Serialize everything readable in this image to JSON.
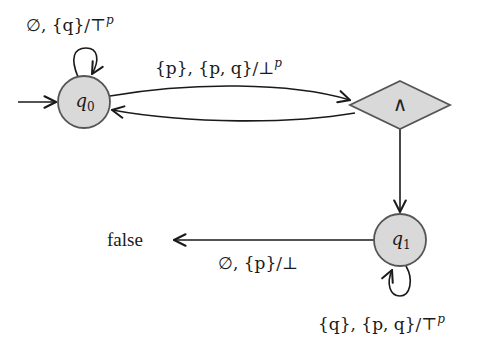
{
  "diagram": {
    "type": "alternating automaton",
    "colors": {
      "node_fill": "#d9d9d9",
      "node_stroke": "#555555",
      "edge": "#1a1a1a",
      "background": "#ffffff"
    },
    "nodes": [
      {
        "id": "q0",
        "label": "q",
        "subscript": "0",
        "shape": "circle",
        "initial": true
      },
      {
        "id": "and",
        "label": "∧",
        "shape": "diamond"
      },
      {
        "id": "q1",
        "label": "q",
        "subscript": "1",
        "shape": "circle"
      },
      {
        "id": "false",
        "label": "false",
        "shape": "text"
      }
    ],
    "edges": [
      {
        "from": "q0",
        "to": "q0",
        "label": "∅, {q}/⊤",
        "sup": "p"
      },
      {
        "from": "q0",
        "to": "and",
        "label": "{p}, {p, q}/⊥",
        "sup": "p"
      },
      {
        "from": "and",
        "to": "q0",
        "label": ""
      },
      {
        "from": "and",
        "to": "q1",
        "label": ""
      },
      {
        "from": "q1",
        "to": "false",
        "label": "∅, {p}/⊥",
        "sup": ""
      },
      {
        "from": "q1",
        "to": "q1",
        "label": "{q}, {p, q}/⊤",
        "sup": "p"
      }
    ]
  }
}
